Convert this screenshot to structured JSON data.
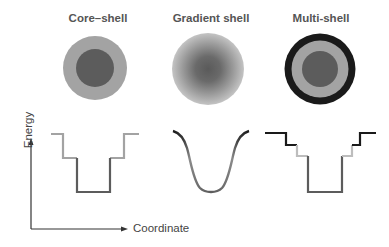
{
  "panels": [
    {
      "title": "Core–shell",
      "type": "core-shell"
    },
    {
      "title": "Gradient shell",
      "type": "gradient-shell"
    },
    {
      "title": "Multi-shell",
      "type": "multi-shell"
    }
  ],
  "axes": {
    "y_label": "Energy",
    "x_label": "Coordinate"
  },
  "colors": {
    "core": "#5c5c5c",
    "shell": "#a3a3a3",
    "outer_shell": "#1a1a1a",
    "light_shell": "#bdbdbd",
    "axis": "#333333",
    "title": "#555555"
  }
}
